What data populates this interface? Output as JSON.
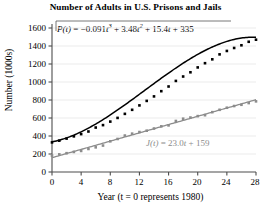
{
  "chart_data": {
    "type": "scatter",
    "title": "Number of Adults in U.S. Prisons and Jails",
    "xlabel": "Year (t = 0 represents 1980)",
    "ylabel": "Number (1000s)",
    "xlim": [
      0,
      28
    ],
    "ylim": [
      0,
      1600
    ],
    "xticks": [
      0,
      4,
      8,
      12,
      16,
      20,
      24,
      28
    ],
    "yticks": [
      0,
      200,
      400,
      600,
      800,
      1000,
      1200,
      1400,
      1600
    ],
    "grid": "horizontal-faint",
    "legend": "inline-annotations",
    "annotations": [
      {
        "name": "prison-model-equation",
        "text": "P(t) = −0.091t³ + 3.48t² + 15.4t + 335",
        "color": "#000000",
        "parts": {
          "lhs": "P(t)",
          "eq": "=",
          "c3": "−0.091",
          "t3": "t",
          "exp3": "3",
          "plus1": "+",
          "c2": "3.48",
          "t2": "t",
          "exp2": "2",
          "plus2": "+",
          "c1": "15.4",
          "t1": "t",
          "plus3": "+",
          "c0": "335"
        }
      },
      {
        "name": "jail-model-equation",
        "text": "J(t) = 23.0t + 159",
        "color": "#8c8c8c",
        "parts": {
          "lhs": "J(t)",
          "eq": "=",
          "slope": "23.0",
          "t1": "t",
          "plus": "+",
          "intercept": "159"
        }
      }
    ],
    "series": [
      {
        "name": "Prisons P(t)",
        "color": "#000000",
        "marker": "filled-square",
        "curve": "cubic",
        "x": [
          0,
          1,
          2,
          3,
          4,
          5,
          6,
          7,
          8,
          9,
          10,
          11,
          12,
          13,
          14,
          15,
          16,
          17,
          18,
          19,
          20,
          21,
          22,
          23,
          24,
          25,
          26,
          27,
          28
        ],
        "y": [
          329,
          348,
          371,
          396,
          421,
          450,
          494,
          521,
          560,
          601,
          646,
          691,
          740,
          790,
          840,
          898,
          950,
          1012,
          1061,
          1108,
          1162,
          1209,
          1252,
          1307,
          1345,
          1378,
          1408,
          1447,
          1470
        ]
      },
      {
        "name": "Jails J(t)",
        "color": "#8c8c8c",
        "marker": "filled-square",
        "curve": "linear",
        "x": [
          0,
          1,
          2,
          3,
          4,
          5,
          6,
          7,
          8,
          9,
          10,
          11,
          12,
          13,
          14,
          15,
          16,
          17,
          18,
          19,
          20,
          21,
          22,
          23,
          24,
          25,
          26,
          27,
          28
        ],
        "y": [
          183,
          196,
          209,
          223,
          234,
          256,
          274,
          294,
          341,
          367,
          405,
          426,
          444,
          459,
          483,
          507,
          518,
          567,
          592,
          605,
          621,
          631,
          665,
          691,
          714,
          733,
          747,
          766,
          785
        ]
      }
    ]
  },
  "axis": {
    "y_ticks": [
      "1600",
      "1400",
      "1200",
      "1000",
      "800",
      "600",
      "400",
      "200",
      "0"
    ],
    "x_ticks": [
      "0",
      "4",
      "8",
      "12",
      "16",
      "20",
      "24",
      "28"
    ],
    "y_title": "Number (1000s)",
    "x_title": "Year (t = 0 represents 1980)"
  },
  "title": {
    "text": "Number of Adults in U.S. Prisons and Jails"
  },
  "colors": {
    "prison": "#000000",
    "jail": "#8c8c8c",
    "axis": "#4d4d4d",
    "grid": "#e6e6e6",
    "background": "#ffffff"
  }
}
